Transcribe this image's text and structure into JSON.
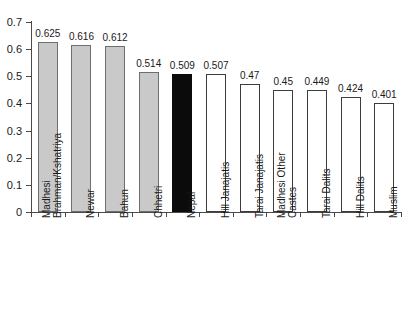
{
  "chart_data": {
    "type": "bar",
    "title": "",
    "subtitle": "",
    "xlabel": "",
    "ylabel": "",
    "ylim": [
      0,
      0.7
    ],
    "ytick_labels": [
      "0.7",
      "0.6",
      "0.5",
      "0.4",
      "0.3",
      "0.2",
      "0.1",
      "0"
    ],
    "ytick_values": [
      0.7,
      0.6,
      0.5,
      0.4,
      0.3,
      0.2,
      0.1,
      0
    ],
    "grid": false,
    "legend": "none",
    "categories": [
      "Madhesi Brahman/Kshatriya",
      "Newar",
      "Bahun",
      "Chhetri",
      "Nepal",
      "Hill Janajatis",
      "Tarai Janajatis",
      "Madhesi Other Castes",
      "Tarai Dalits",
      "Hill Dalits",
      "Muslim"
    ],
    "values": [
      0.625,
      0.616,
      0.612,
      0.514,
      0.509,
      0.507,
      0.47,
      0.45,
      0.449,
      0.424,
      0.401
    ],
    "value_labels": [
      "0.625",
      "0.616",
      "0.612",
      "0.514",
      "0.509",
      "0.507",
      "0.47",
      "0.45",
      "0.449",
      "0.424",
      "0.401"
    ],
    "bar_styles": [
      "gray",
      "gray",
      "gray",
      "gray",
      "black",
      "white",
      "white",
      "white",
      "white",
      "white",
      "white"
    ],
    "category_label_lines": [
      [
        "Madhesi",
        "Brahman/Kshatriya"
      ],
      [
        "Newar"
      ],
      [
        "Bahun"
      ],
      [
        "Chhetri"
      ],
      [
        "Nepal"
      ],
      [
        "Hill Janajatis"
      ],
      [
        "Tarai Janajatis"
      ],
      [
        "Madhesi Other",
        "Castes"
      ],
      [
        "Tarai Dalits"
      ],
      [
        "Hill Dalits"
      ],
      [
        "Muslim"
      ]
    ],
    "colors": {
      "bar_gray_fill": "#c9c9c9",
      "bar_gray_edge": "#6e6e6e",
      "bar_black_fill": "#0b0b0b",
      "bar_white_fill": "#ffffff",
      "bar_white_edge": "#3d3d3d",
      "axis": "#4a4a4a",
      "text": "#1a1a1a",
      "background": "#ffffff"
    }
  },
  "yticks": [
    {
      "label": "0.7"
    },
    {
      "label": "0.6"
    },
    {
      "label": "0.5"
    },
    {
      "label": "0.4"
    },
    {
      "label": "0.3"
    },
    {
      "label": "0.2"
    },
    {
      "label": "0.1"
    },
    {
      "label": "0"
    }
  ],
  "bars": [
    {
      "value_label": "0.625",
      "line1": "Madhesi",
      "line2": "Brahman/Kshatriya"
    },
    {
      "value_label": "0.616",
      "line1": "Newar",
      "line2": ""
    },
    {
      "value_label": "0.612",
      "line1": "Bahun",
      "line2": ""
    },
    {
      "value_label": "0.514",
      "line1": "Chhetri",
      "line2": ""
    },
    {
      "value_label": "0.509",
      "line1": "Nepal",
      "line2": ""
    },
    {
      "value_label": "0.507",
      "line1": "Hill Janajatis",
      "line2": ""
    },
    {
      "value_label": "0.47",
      "line1": "Tarai Janajatis",
      "line2": ""
    },
    {
      "value_label": "0.45",
      "line1": "Madhesi Other",
      "line2": "Castes"
    },
    {
      "value_label": "0.449",
      "line1": "Tarai Dalits",
      "line2": ""
    },
    {
      "value_label": "0.424",
      "line1": "Hill Dalits",
      "line2": ""
    },
    {
      "value_label": "0.401",
      "line1": "Muslim",
      "line2": ""
    }
  ]
}
